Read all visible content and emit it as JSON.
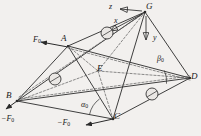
{
  "figure": {
    "type": "engineering-mechanics-diagram",
    "background_color": "#f2f0ee",
    "line_color": "#2a2a2a",
    "dashed_color": "#555555"
  },
  "vertices": [
    {
      "id": "G",
      "label": "G",
      "x": 145,
      "y": 12,
      "label_x": 146,
      "label_y": 3
    },
    {
      "id": "A",
      "label": "A",
      "x": 68,
      "y": 46,
      "label_x": 62,
      "label_y": 35
    },
    {
      "id": "D",
      "label": "D",
      "x": 190,
      "y": 78,
      "label_x": 191,
      "label_y": 73
    },
    {
      "id": "B",
      "label": "B",
      "x": 17,
      "y": 101,
      "label_x": 8,
      "label_y": 92
    },
    {
      "id": "C",
      "label": "C",
      "x": 113,
      "y": 119,
      "label_x": 114,
      "label_y": 113
    },
    {
      "id": "E",
      "label": "E",
      "x": 98,
      "y": 71,
      "label_x": 98,
      "label_y": 65
    }
  ],
  "axes": [
    {
      "id": "z",
      "label": "z",
      "label_x": 110,
      "label_y": 4,
      "arrow_from_x": 142,
      "arrow_from_y": 11,
      "arrow_to_x": 118,
      "arrow_to_y": 9
    },
    {
      "id": "x",
      "label": "x",
      "label_x": 115,
      "label_y": 19,
      "arrow_from_x": 142,
      "arrow_from_y": 14,
      "arrow_to_x": 108,
      "arrow_to_y": 32
    },
    {
      "id": "y",
      "label": "y",
      "label_x": 155,
      "label_y": 38,
      "arrow_from_x": 146,
      "arrow_from_y": 16,
      "arrow_to_x": 146,
      "arrow_to_y": 42
    }
  ],
  "forces": [
    {
      "id": "F0-at-A",
      "label": "F",
      "sub": "0",
      "label_x": 36,
      "label_y": 38,
      "arrow_from_x": 68,
      "arrow_from_y": 47,
      "arrow_to_x": 39,
      "arrow_to_y": 42
    },
    {
      "id": "negF0-at-B",
      "label": "−F",
      "sub": "0",
      "label_x": 2,
      "label_y": 117,
      "arrow_from_x": 17,
      "arrow_from_y": 101,
      "arrow_to_x": 5,
      "arrow_to_y": 110
    },
    {
      "id": "negF0-at-C",
      "label": "−F",
      "sub": "0",
      "label_x": 58,
      "label_y": 121,
      "arrow_from_x": 113,
      "arrow_from_y": 119,
      "arrow_to_x": 84,
      "arrow_to_y": 126
    }
  ],
  "angles": [
    {
      "id": "alpha0",
      "label": "α",
      "sub": "0",
      "label_x": 83,
      "label_y": 103,
      "vertex_x": 113,
      "vertex_y": 119,
      "radius": 26
    },
    {
      "id": "beta0",
      "label": "β",
      "sub": "0",
      "label_x": 158,
      "label_y": 57,
      "vertex_x": 190,
      "vertex_y": 78,
      "radius": 26
    }
  ],
  "joints": [
    {
      "id": "joint-GA-edge",
      "cx": 107,
      "cy": 33,
      "r": 6
    },
    {
      "id": "joint-BA-edge",
      "cx": 55,
      "cy": 79,
      "r": 6
    },
    {
      "id": "joint-CD-edge",
      "cx": 152,
      "cy": 94,
      "r": 6
    }
  ],
  "edges": {
    "solid": [
      "G-A",
      "G-D",
      "G-C",
      "G-B",
      "A-B",
      "A-C",
      "B-C",
      "C-D",
      "A-D",
      "B-D"
    ],
    "dashed": [
      "A-E",
      "E-C",
      "E-D",
      "B-E",
      "G-E",
      "A-D-inner",
      "B-D-inner"
    ]
  }
}
